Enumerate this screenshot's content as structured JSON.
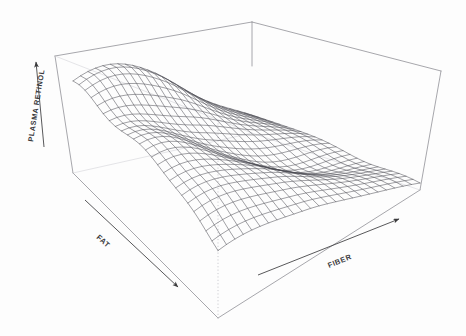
{
  "figure": {
    "kind": "3d-wireframe-surface-plot",
    "background_color": "#fdfdfd",
    "ink_color": "#3a3a3c",
    "mesh_color": "#4a4a52",
    "frame_color": "#8a8a90",
    "dotted_color": "#b9b9bf"
  },
  "axes": {
    "vertical": {
      "label": "PLASMA RETINOL",
      "name": "plasma-retinol-axis",
      "arrow_direction": "up",
      "label_rotation_deg": -81
    },
    "left_horizontal": {
      "label": "FAT",
      "name": "fat-axis",
      "arrow_direction": "down-right",
      "label_rotation_deg": 42
    },
    "right_horizontal": {
      "label": "FIBER",
      "name": "fiber-axis",
      "arrow_direction": "up-right",
      "label_rotation_deg": -22
    }
  },
  "chart_data": {
    "type": "surface",
    "title": "",
    "xlabel": "FAT",
    "ylabel": "FIBER",
    "zlabel": "PLASMA RETINOL",
    "grid": false,
    "legend": "none",
    "projection": "3d-wireframe-mesh",
    "x": [
      0,
      0.0417,
      0.0833,
      0.125,
      0.1667,
      0.2083,
      0.25,
      0.2917,
      0.3333,
      0.375,
      0.4167,
      0.4583,
      0.5,
      0.5417,
      0.5833,
      0.625,
      0.6667,
      0.7083,
      0.75,
      0.7917,
      0.8333,
      0.875,
      0.9167,
      0.9583,
      1
    ],
    "y": [
      0,
      0.0417,
      0.0833,
      0.125,
      0.1667,
      0.2083,
      0.25,
      0.2917,
      0.3333,
      0.375,
      0.4167,
      0.4583,
      0.5,
      0.5417,
      0.5833,
      0.625,
      0.6667,
      0.7083,
      0.75,
      0.7917,
      0.8333,
      0.875,
      0.9167,
      0.9583,
      1
    ],
    "xlim": [
      0,
      1
    ],
    "ylim": [
      0,
      1
    ],
    "zlim": [
      0,
      1
    ],
    "surface_shape_notes": "Saddle-like ridge: high crest along the back-left to back-centre, a raised curled lip at the far left (low FAT), a deep valley running diagonally toward the front-right corner, and a steep stepped drop-off down the right (high FIBER) flank.",
    "z_description": "Fitted nonparametric regression surface of plasma retinol on dietary fat and fiber",
    "mesh_rows": 25,
    "mesh_cols": 25
  }
}
